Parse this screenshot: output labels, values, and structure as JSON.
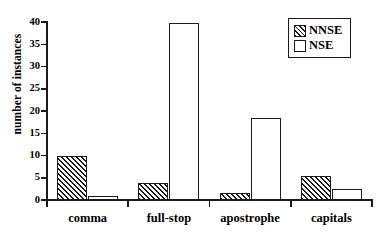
{
  "chart_data": {
    "type": "bar",
    "title": "",
    "subtitle": "",
    "xlabel": "",
    "ylabel": "number of instances",
    "categories": [
      "comma",
      "full-stop",
      "apostrophe",
      "capitals"
    ],
    "series": [
      {
        "name": "NNSE",
        "fill": "hatched",
        "values": [
          10,
          3.8,
          1.6,
          5.4
        ]
      },
      {
        "name": "NSE",
        "fill": "empty",
        "values": [
          0.9,
          39.7,
          18.5,
          2.4
        ]
      }
    ],
    "ylim": [
      0,
      40
    ],
    "yticks": [
      0,
      5,
      10,
      15,
      20,
      25,
      30,
      35,
      40
    ],
    "ytick_labels": [
      "0",
      "5",
      "10",
      "15",
      "20",
      "25",
      "30",
      "35",
      "40"
    ],
    "grid": false,
    "legend_position": "top-right",
    "legend_entries": [
      "NNSE",
      "NSE"
    ],
    "colors": {
      "axis": "#1a1a1a",
      "bar_edge": "#1a1a1a",
      "bar_fill_empty": "#ffffff",
      "hatch": "#1a1a1a",
      "background": "#ffffff"
    }
  }
}
